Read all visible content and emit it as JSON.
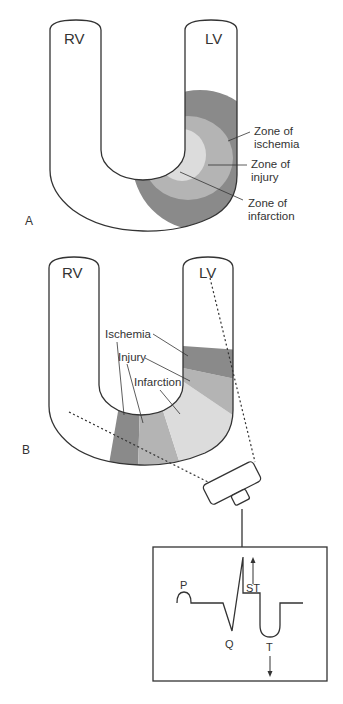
{
  "panel_a": {
    "letter": "A",
    "rv_label": "RV",
    "lv_label": "LV",
    "zones": [
      {
        "line1": "Zone of",
        "line2": "ischemia",
        "color": "#8a8a8a"
      },
      {
        "line1": "Zone of",
        "line2": "injury",
        "color": "#b4b4b4"
      },
      {
        "line1": "Zone of",
        "line2": "infarction",
        "color": "#dcdcdc"
      }
    ]
  },
  "panel_b": {
    "letter": "B",
    "rv_label": "RV",
    "lv_label": "LV",
    "labels": {
      "ischemia": "Ischemia",
      "injury": "Injury",
      "infarction": "Infarction"
    },
    "colors": {
      "ischemia": "#8a8a8a",
      "injury": "#b4b4b4",
      "infarction": "#dcdcdc"
    }
  },
  "ecg": {
    "p_label": "P",
    "q_label": "Q",
    "st_label": "ST",
    "t_label": "T"
  }
}
